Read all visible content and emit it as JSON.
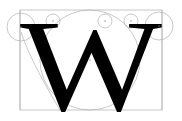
{
  "diagram": {
    "glyph": "W",
    "colors": {
      "glyph": "#000000",
      "guides": "#b0b0b0",
      "background": "#ffffff"
    }
  }
}
